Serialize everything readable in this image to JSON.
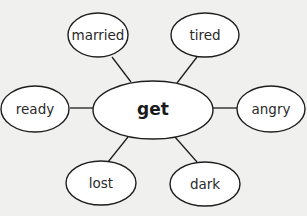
{
  "diagram": {
    "type": "word-web",
    "center": {
      "label": "get",
      "cx": 153,
      "cy": 110,
      "rx": 60,
      "ry": 29
    },
    "nodes": [
      {
        "id": "married",
        "label": "married",
        "cx": 98,
        "cy": 35,
        "rx": 30,
        "ry": 22,
        "edge": [
          112,
          57,
          131,
          82
        ]
      },
      {
        "id": "tired",
        "label": "tired",
        "cx": 205,
        "cy": 35,
        "rx": 34,
        "ry": 22,
        "edge": [
          197,
          57,
          177,
          83
        ]
      },
      {
        "id": "ready",
        "label": "ready",
        "cx": 35,
        "cy": 109,
        "rx": 34,
        "ry": 23,
        "edge": [
          70,
          108,
          93,
          108
        ]
      },
      {
        "id": "angry",
        "label": "angry",
        "cx": 271,
        "cy": 109,
        "rx": 34,
        "ry": 23,
        "edge": [
          213,
          108,
          237,
          108
        ]
      },
      {
        "id": "lost",
        "label": "lost",
        "cx": 101,
        "cy": 183,
        "rx": 35,
        "ry": 22,
        "edge": [
          128,
          137,
          108,
          162
        ]
      },
      {
        "id": "dark",
        "label": "dark",
        "cx": 205,
        "cy": 184,
        "rx": 35,
        "ry": 22,
        "edge": [
          175,
          137,
          197,
          162
        ]
      }
    ],
    "colors": {
      "background": "#f0f0ef",
      "stroke": "#1e1e1e",
      "fill": "#ffffff",
      "text": "#2a2a2a"
    }
  }
}
